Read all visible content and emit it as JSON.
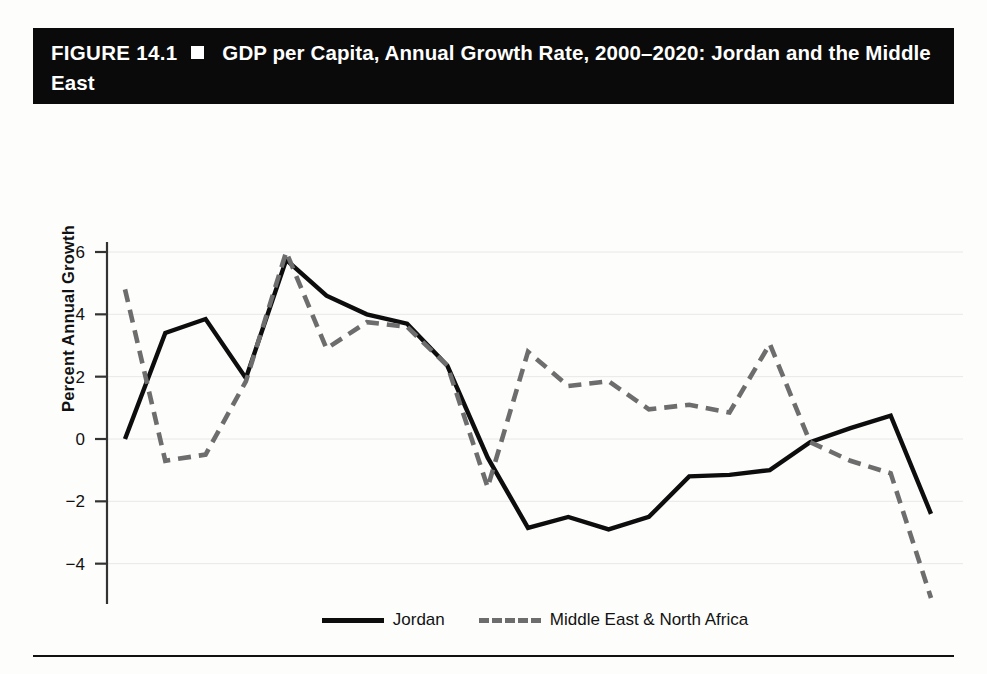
{
  "figure": {
    "label": "FIGURE 14.1",
    "square_icon": "black-square-icon",
    "caption": "GDP per Capita, Annual Growth Rate, 2000–2020: Jordan and the Middle East"
  },
  "legend": {
    "jordan_label": "Jordan",
    "mena_label": "Middle East & North Africa"
  },
  "colors": {
    "jordan": "#0d0d0d",
    "mena": "#6d6d6d",
    "banner_bg": "#0a0a0a",
    "banner_fg": "#ffffff",
    "grid": "#e8e8e8",
    "axis": "#333333"
  },
  "chart_data": {
    "type": "line",
    "title": "GDP per Capita, Annual Growth Rate, 2000–2020: Jordan and the Middle East",
    "xlabel": "",
    "ylabel": "Percent Annual Growth",
    "categories": [
      "2000",
      "2001",
      "2002",
      "2003",
      "2004",
      "2005",
      "2006",
      "2007",
      "2008",
      "2009",
      "2010",
      "2011",
      "2012",
      "2013",
      "2014",
      "2015",
      "2016",
      "2017",
      "2018",
      "2019",
      "2020"
    ],
    "x_tick_labels": [
      "2000",
      "2001",
      "2002",
      "2003",
      "2004",
      "2005",
      "2006",
      "2007",
      "2008",
      "2009",
      "2010",
      "2011",
      "2012",
      "2013",
      "2014",
      "2015",
      "2016",
      "2017",
      "2018",
      "2019",
      "2020"
    ],
    "x_tick_rotation": -90,
    "y_tick_labels": [
      "6",
      "4",
      "2",
      "0",
      "−2",
      "−4",
      "−6"
    ],
    "y_ticks": [
      6,
      4,
      2,
      0,
      -2,
      -4,
      -6
    ],
    "ylim": [
      -6,
      6
    ],
    "grid": "horizontal",
    "legend_position": "bottom-center",
    "series": [
      {
        "name": "Jordan",
        "style": "solid",
        "color": "#0d0d0d",
        "values": [
          0.0,
          3.4,
          3.85,
          1.95,
          5.75,
          4.6,
          4.0,
          3.7,
          2.35,
          -0.6,
          -2.85,
          -2.5,
          -2.9,
          -2.5,
          -1.2,
          -1.15,
          -1.0,
          -0.1,
          0.35,
          0.75,
          -2.4
        ]
      },
      {
        "name": "Middle East & North Africa",
        "style": "dashed",
        "color": "#6d6d6d",
        "values": [
          4.8,
          -0.7,
          -0.5,
          1.85,
          6.0,
          2.9,
          3.75,
          3.6,
          2.35,
          -1.55,
          2.8,
          1.7,
          1.85,
          0.95,
          1.1,
          0.85,
          3.05,
          -0.1,
          -0.7,
          -1.1,
          -5.1
        ]
      }
    ]
  }
}
